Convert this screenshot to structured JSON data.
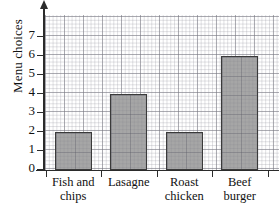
{
  "chart_data": {
    "type": "bar",
    "title": "",
    "xlabel": "",
    "ylabel": "Menu choices",
    "categories": [
      "Fish and chips",
      "Lasagne",
      "Roast chicken",
      "Beef burger"
    ],
    "category_lines": [
      [
        "Fish and",
        "chips"
      ],
      [
        "Lasagne",
        ""
      ],
      [
        "Roast",
        "chicken"
      ],
      [
        "Beef",
        "burger"
      ]
    ],
    "values": [
      2,
      4,
      2,
      6
    ],
    "ylim": [
      0,
      7.8
    ],
    "ytick_labels": [
      "0",
      "1",
      "2",
      "3",
      "4",
      "5",
      "6",
      "7"
    ],
    "ytick_values": [
      0,
      1,
      2,
      3,
      4,
      5,
      6,
      7
    ],
    "grid": true,
    "grid_style": "graph-paper",
    "legend": "none",
    "bar_fill_color": "#a6a6a6",
    "bar_edge_color": "#3a3a3a",
    "axis_color": "#2b2b2b",
    "background_color": "#ffffff",
    "y_axis_has_arrow": true
  },
  "axis": {
    "y_title": "Menu choices"
  }
}
